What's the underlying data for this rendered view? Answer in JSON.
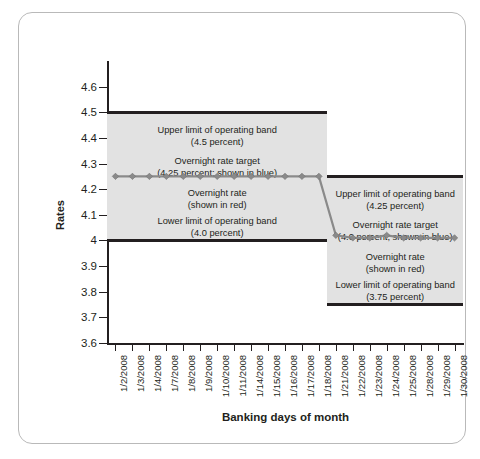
{
  "chart_data": {
    "type": "line",
    "title": "",
    "xlabel": "Banking days of month",
    "ylabel": "Rates",
    "ylim": [
      3.6,
      4.7
    ],
    "ytick_labels": [
      "4.6",
      "4.5",
      "4.4",
      "4.3",
      "4.2",
      "4.1",
      "4",
      "3.9",
      "3.8",
      "3.7",
      "3.6"
    ],
    "ytick_values": [
      4.6,
      4.5,
      4.4,
      4.3,
      4.2,
      4.1,
      4.0,
      3.9,
      3.8,
      3.7,
      3.6
    ],
    "grid": false,
    "legend_position": "none",
    "categories": [
      "1/2/2008",
      "1/3/2008",
      "1/4/2008",
      "1/7/2008",
      "1/8/2008",
      "1/9/2008",
      "1/10/2008",
      "1/11/2008",
      "1/14/2008",
      "1/15/2008",
      "1/16/2008",
      "1/17/2008",
      "1/18/2008",
      "1/21/2008",
      "1/22/2008",
      "1/23/2008",
      "1/24/2008",
      "1/25/2008",
      "1/28/2008",
      "1/29/2008",
      "1/30/2008"
    ],
    "series": [
      {
        "name": "Overnight rate",
        "color": "#8a8a8a",
        "values": [
          4.25,
          4.25,
          4.25,
          4.25,
          4.25,
          4.25,
          4.25,
          4.25,
          4.25,
          4.25,
          4.25,
          4.25,
          4.25,
          4.02,
          4.01,
          4.01,
          4.02,
          4.01,
          4.01,
          4.01,
          4.01
        ]
      }
    ],
    "bands": [
      {
        "id": "band-1",
        "start_index": 0,
        "end_index": 12,
        "upper": 4.5,
        "lower": 4.0,
        "fill": "#e2e2e2",
        "notes": [
          {
            "line1": "Upper limit of operating band",
            "line2": "(4.5 percent)"
          },
          {
            "line1": "Overnight rate target",
            "line2": "(4.25 percent; shown in blue)"
          },
          {
            "line1": "Overnight rate",
            "line2": "(shown in red)"
          },
          {
            "line1": "Lower limit of operating band",
            "line2": "(4.0 percent)"
          }
        ]
      },
      {
        "id": "band-2",
        "start_index": 13,
        "end_index": 20,
        "upper": 4.25,
        "lower": 3.75,
        "fill": "#e2e2e2",
        "notes": [
          {
            "line1": "Upper limit of operating band",
            "line2": "(4.25 percent)"
          },
          {
            "line1": "Overnight rate target",
            "line2": "(4.0 percent; shown in blue)"
          },
          {
            "line1": "Overnight rate",
            "line2": "(shown in red)"
          },
          {
            "line1": "Lower limit of operating band",
            "line2": "(3.75 percent)"
          }
        ]
      }
    ]
  },
  "axes": {
    "y_title": "Rates",
    "x_title": "Banking days of month"
  },
  "colors": {
    "band_fill": "#e2e2e2",
    "band_edge": "#231f20",
    "series_line": "#8a8a8a",
    "axis": "#231f20",
    "frame_border": "#b9b9b9"
  }
}
